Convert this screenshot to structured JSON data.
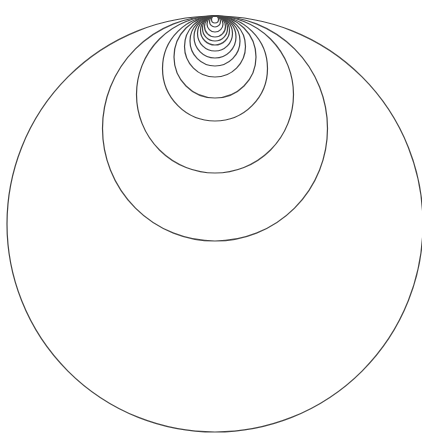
{
  "diagram": {
    "type": "nested-tangent-circles",
    "tangent_point": {
      "x": 215,
      "y": 16
    },
    "stroke_color": "#444444",
    "stroke_width": 1.2,
    "background": "#ffffff",
    "diameters": [
      416,
      225,
      157,
      105,
      82,
      61,
      50,
      42,
      35,
      29,
      25,
      21,
      16,
      11,
      7
    ]
  }
}
